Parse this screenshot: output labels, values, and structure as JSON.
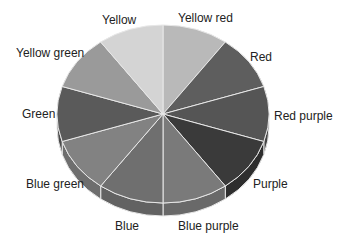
{
  "chart_data": {
    "type": "pie",
    "style": "3d",
    "title": "",
    "categories": [
      "Yellow red",
      "Red",
      "Red purple",
      "Purple",
      "Blue purple",
      "Blue",
      "Blue green",
      "Green",
      "Yellow green",
      "Yellow"
    ],
    "values": [
      10,
      10,
      10,
      10,
      10,
      10,
      10,
      10,
      10,
      10
    ],
    "colors": [
      "#b9b9b9",
      "#5e5e5e",
      "#555555",
      "#3a3a3a",
      "#7a7a7a",
      "#6f6f6f",
      "#828282",
      "#5a5a5a",
      "#9a9a9a",
      "#d4d4d4"
    ],
    "side_colors": [
      "#a0a0a0",
      "#4a4a4a",
      "#444444",
      "#2e2e2e",
      "#696969",
      "#626262",
      "#6e6e6e",
      "#4a4a4a",
      "#858585",
      "#bcbcbc"
    ],
    "start_angle_deg": -90,
    "direction": "clockwise",
    "legend": "none",
    "labels_position": "outside"
  },
  "labels": [
    {
      "text": "Yellow red",
      "x": 178,
      "y": 22
    },
    {
      "text": "Red",
      "x": 250,
      "y": 61
    },
    {
      "text": "Red purple",
      "x": 274,
      "y": 120
    },
    {
      "text": "Purple",
      "x": 253,
      "y": 188
    },
    {
      "text": "Blue purple",
      "x": 178,
      "y": 230
    },
    {
      "text": "Blue",
      "x": 115,
      "y": 230
    },
    {
      "text": "Blue green",
      "x": 26,
      "y": 188
    },
    {
      "text": "Green",
      "x": 22,
      "y": 118
    },
    {
      "text": "Yellow green",
      "x": 16,
      "y": 57
    },
    {
      "text": "Yellow",
      "x": 102,
      "y": 24
    }
  ]
}
